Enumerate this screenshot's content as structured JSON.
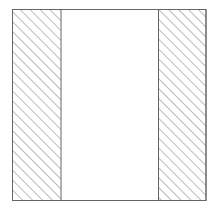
{
  "diagram": {
    "type": "cross-section",
    "outer": {
      "x": 12,
      "y": 9,
      "width": 194,
      "height": 192
    },
    "regions": [
      {
        "name": "left-wall",
        "x": 12,
        "y": 9,
        "width": 49,
        "height": 192,
        "fill": "hatch"
      },
      {
        "name": "center-cavity",
        "x": 61,
        "y": 9,
        "width": 97,
        "height": 192,
        "fill": "none"
      },
      {
        "name": "right-wall",
        "x": 158,
        "y": 9,
        "width": 48,
        "height": 192,
        "fill": "hatch"
      }
    ],
    "hatch_spacing": 7,
    "stroke_color": "#666666",
    "hatch_color": "#777777"
  }
}
